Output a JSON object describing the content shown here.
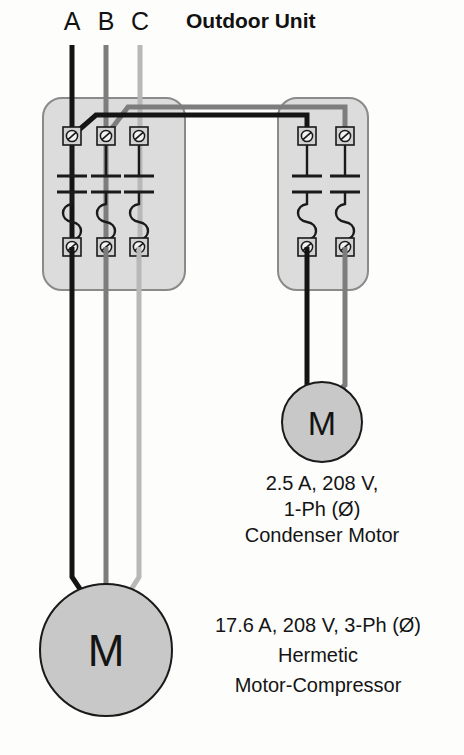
{
  "diagram": {
    "title": "Outdoor Unit",
    "type": "electrical-wiring-diagram",
    "background_color": "#fdfdfc",
    "phase_conductors": [
      {
        "label": "A",
        "color": "#141414",
        "name": "phase-a"
      },
      {
        "label": "B",
        "color": "#7d7d7d",
        "name": "phase-b"
      },
      {
        "label": "C",
        "color": "#b8b8b8",
        "name": "phase-c"
      }
    ],
    "enclosures": [
      {
        "name": "compressor-disconnect",
        "fuse_count": 3,
        "fill_color": "#dcdcdc",
        "stroke_color": "#7a7a7a"
      },
      {
        "name": "condenser-fan-disconnect",
        "fuse_count": 2,
        "fill_color": "#dcdcdc",
        "stroke_color": "#7a7a7a"
      }
    ],
    "symbols": {
      "terminal": "screw-terminal",
      "fuse": "cartridge-fuse",
      "motor": "motor-circle"
    },
    "motors": [
      {
        "name": "condenser-motor",
        "glyph": "M",
        "fill_color": "#c8c8c8",
        "spec_lines": [
          "2.5 A,  208 V,",
          "1-Ph (Ø)",
          "Condenser Motor"
        ]
      },
      {
        "name": "hermetic-motor-compressor",
        "glyph": "M",
        "fill_color": "#c8c8c8",
        "spec_lines": [
          "17.6 A,  208 V, 3-Ph (Ø)",
          "Hermetic",
          "Motor-Compressor"
        ]
      }
    ]
  }
}
